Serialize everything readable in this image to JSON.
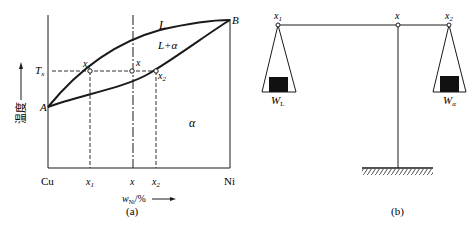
{
  "panel_a": {
    "caption": "(a)",
    "y_axis_label": "温度",
    "x_axis_label_main": "w",
    "x_axis_label_sub": "Ni",
    "x_axis_label_unit": "/%",
    "left_element": "Cu",
    "right_element": "Ni",
    "point_A": "A",
    "point_B": "B",
    "temp_label_main": "T",
    "temp_label_sub": "x",
    "region_liquid": "L",
    "region_two_phase": "L+α",
    "region_solid": "α",
    "point_x1_main": "x",
    "point_x1_sub": "1",
    "point_x": "x",
    "point_x2_main": "x",
    "point_x2_sub": "2",
    "tick_x1_main": "x",
    "tick_x1_sub": "1",
    "tick_x": "x",
    "tick_x2_main": "x",
    "tick_x2_sub": "2"
  },
  "panel_b": {
    "caption": "(b)",
    "left_point_main": "x",
    "left_point_sub": "1",
    "pivot_point": "x",
    "right_point_main": "x",
    "right_point_sub": "2",
    "left_weight_main": "W",
    "left_weight_sub": "L",
    "right_weight_main": "W",
    "right_weight_sub": "α"
  },
  "colors": {
    "ink": "#1a1a1a",
    "background": "#ffffff"
  }
}
